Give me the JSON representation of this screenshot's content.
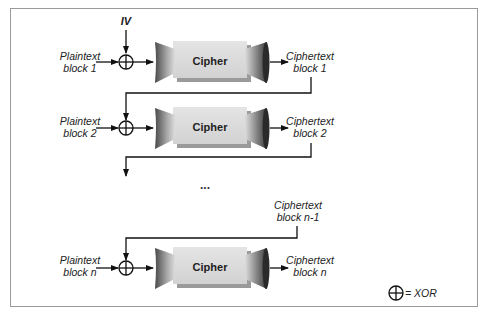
{
  "diagram": {
    "iv_label": "IV",
    "rows": [
      {
        "plaintext_line1": "Plaintext",
        "plaintext_line2": "block 1",
        "cipher_label": "Cipher",
        "ciphertext_line1": "Ciphertext",
        "ciphertext_line2": "block 1"
      },
      {
        "plaintext_line1": "Plaintext",
        "plaintext_line2": "block 2",
        "cipher_label": "Cipher",
        "ciphertext_line1": "Ciphertext",
        "ciphertext_line2": "block 2"
      },
      {
        "plaintext_line1": "Plaintext",
        "plaintext_line2": "block n",
        "cipher_label": "Cipher",
        "ciphertext_line1": "Ciphertext",
        "ciphertext_line2": "block n"
      }
    ],
    "prev_cipher": {
      "line1": "Ciphertext",
      "line2": "block n-1"
    },
    "ellipsis": "...",
    "legend": {
      "symbol": "xor-symbol",
      "text": "= XOR"
    },
    "colors": {
      "box_face": "#dcdcdc",
      "box_shadow": "#9a9a9a",
      "funnel_dark": "#555555",
      "funnel_light": "#d0d0d0",
      "lines": "#111111",
      "frame": "#9a9a9a"
    }
  }
}
